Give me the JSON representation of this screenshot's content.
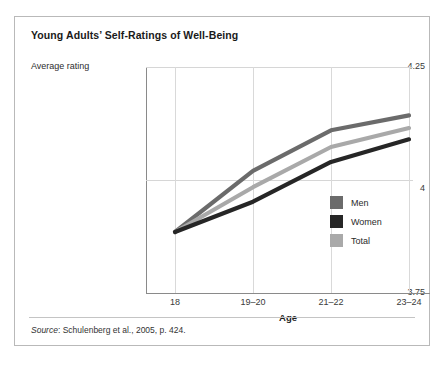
{
  "figure": {
    "title": "Young Adults’ Self-Ratings of Well-Being",
    "source_label": "Source",
    "source_text": ": Schulenberg et al., 2005, p. 424."
  },
  "axes": {
    "y_axis_title": "Average rating",
    "x_axis_title": "Age",
    "y_ticks": [
      "4.25",
      "4",
      "3.75"
    ],
    "x_ticks": [
      "18",
      "19–20",
      "21–22",
      "23–24"
    ]
  },
  "legend": {
    "items": [
      {
        "label": "Men",
        "color": "#6b6b6b"
      },
      {
        "label": "Women",
        "color": "#262626"
      },
      {
        "label": "Total",
        "color": "#a9a9a9"
      }
    ]
  },
  "colors": {
    "men": "#6b6b6b",
    "women": "#262626",
    "total": "#a9a9a9",
    "grid": "#d6d6d6",
    "axis": "#8a8a8a",
    "frame": "#b9b9b9"
  },
  "chart_data": {
    "type": "line",
    "title": "Young Adults’ Self-Ratings of Well-Being",
    "xlabel": "Age",
    "ylabel": "Average rating",
    "categories": [
      "18",
      "19–20",
      "21–22",
      "23–24"
    ],
    "ylim": [
      3.75,
      4.25
    ],
    "yticks": [
      3.75,
      4.0,
      4.25
    ],
    "grid": true,
    "legend_position": "inside-right",
    "series": [
      {
        "name": "Men",
        "color": "#6b6b6b",
        "values": [
          3.885,
          4.02,
          4.11,
          4.143
        ]
      },
      {
        "name": "Women",
        "color": "#262626",
        "values": [
          3.885,
          3.952,
          4.04,
          4.09
        ]
      },
      {
        "name": "Total",
        "color": "#a9a9a9",
        "values": [
          3.885,
          3.984,
          4.073,
          4.115
        ]
      }
    ],
    "annotations": [
      "Source: Schulenberg et al., 2005, p. 424."
    ]
  }
}
